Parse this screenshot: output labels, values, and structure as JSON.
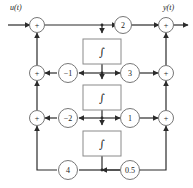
{
  "diagram": {
    "type": "control-system-block-diagram",
    "io": {
      "input_label": "u(t)",
      "output_label": "y(t)"
    },
    "colors": {
      "line": "#2b2b2b",
      "node_stroke": "#777777",
      "block_stroke": "#8a8a8a",
      "text": "#1a1a1a",
      "background": "#ffffff"
    },
    "summing_junctions": [
      {
        "id": "sum-in-top",
        "label": "+",
        "cx": 37,
        "cy": 25
      },
      {
        "id": "sum-in-mid",
        "label": "+",
        "cx": 37,
        "cy": 73
      },
      {
        "id": "sum-in-low",
        "label": "+",
        "cx": 37,
        "cy": 118
      },
      {
        "id": "sum-out-top",
        "label": "+",
        "cx": 166,
        "cy": 25
      },
      {
        "id": "sum-out-mid",
        "label": "+",
        "cx": 166,
        "cy": 73
      },
      {
        "id": "sum-out-low",
        "label": "+",
        "cx": 166,
        "cy": 118
      }
    ],
    "gains": [
      {
        "id": "gain-feedforward-top",
        "label": "2",
        "cx": 123,
        "cy": 25
      },
      {
        "id": "gain-feedback-row2",
        "label": "−1",
        "cx": 68,
        "cy": 73
      },
      {
        "id": "gain-feedforward-row2",
        "label": "3",
        "cx": 130,
        "cy": 73
      },
      {
        "id": "gain-feedback-row3",
        "label": "−2",
        "cx": 68,
        "cy": 118
      },
      {
        "id": "gain-feedforward-row3",
        "label": "1",
        "cx": 130,
        "cy": 118
      },
      {
        "id": "gain-feedback-bottom",
        "label": "4",
        "cx": 68,
        "cy": 170
      },
      {
        "id": "gain-feedforward-bot",
        "label": "0.5",
        "cx": 130,
        "cy": 170
      }
    ],
    "integrators": [
      {
        "id": "integrator-1",
        "label": "∫",
        "x": 83,
        "y": 39,
        "w": 38,
        "h": 25
      },
      {
        "id": "integrator-2",
        "label": "∫",
        "x": 83,
        "y": 85,
        "w": 38,
        "h": 25
      },
      {
        "id": "integrator-3",
        "label": "∫",
        "x": 83,
        "y": 131,
        "w": 38,
        "h": 25
      }
    ]
  }
}
